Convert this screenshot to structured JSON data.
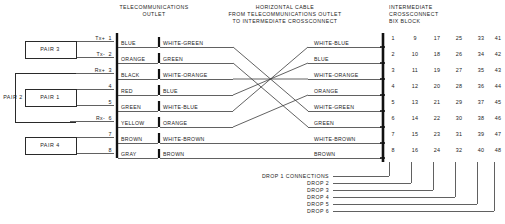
{
  "headers": {
    "left": [
      "TELECOMMUNICATIONS",
      "OUTLET"
    ],
    "middle": [
      "HORIZONTAL CABLE",
      "FROM TELECOMMUNICATIONS OUTLET",
      "TO INTERMEDIATE CROSSCONNECT"
    ],
    "right": [
      "INTERMEDIATE",
      "CROSSCONNECT",
      "BIX BLOCK"
    ]
  },
  "pair_labels": {
    "pair3": "PAIR 3",
    "pair2": "PAIR 2",
    "pair1": "PAIR 1",
    "pair4": "PAIR 4"
  },
  "signals": {
    "row1": "Tx+",
    "row2": "Tx-",
    "row3": "Rx+",
    "row6": "Rx-"
  },
  "pins": [
    "1",
    "2",
    "3",
    "4",
    "5",
    "6",
    "7",
    "8"
  ],
  "outlet_wire_colors": [
    "BLUE",
    "ORANGE",
    "BLACK",
    "RED",
    "GREEN",
    "YELLOW",
    "BROWN",
    "GRAY"
  ],
  "cable_wire_colors_left": [
    "WHITE-GREEN",
    "GREEN",
    "WHITE-ORANGE",
    "BLUE",
    "WHITE-BLUE",
    "ORANGE",
    "WHITE-BROWN",
    "BROWN"
  ],
  "cable_wire_colors_right": [
    "WHITE-BLUE",
    "BLUE",
    "WHITE-ORANGE",
    "ORANGE",
    "WHITE-GREEN",
    "GREEN",
    "WHITE-BROWN",
    "BROWN"
  ],
  "bix_numbers": [
    [
      "1",
      "9",
      "17",
      "25",
      "33",
      "41"
    ],
    [
      "2",
      "10",
      "18",
      "26",
      "34",
      "42"
    ],
    [
      "3",
      "11",
      "19",
      "27",
      "35",
      "43"
    ],
    [
      "4",
      "12",
      "20",
      "28",
      "36",
      "44"
    ],
    [
      "5",
      "13",
      "21",
      "29",
      "37",
      "45"
    ],
    [
      "6",
      "14",
      "22",
      "30",
      "38",
      "46"
    ],
    [
      "7",
      "15",
      "23",
      "31",
      "39",
      "47"
    ],
    [
      "8",
      "16",
      "24",
      "32",
      "40",
      "48"
    ]
  ],
  "drops": [
    "DROP 1 CONNECTIONS",
    "DROP 2",
    "DROP 3",
    "DROP 4",
    "DROP 5",
    "DROP 6"
  ],
  "colors": {
    "ink": "#1b1b1b",
    "line": "#3a3a3a",
    "rail": "#111111",
    "background": "#ffffff"
  }
}
